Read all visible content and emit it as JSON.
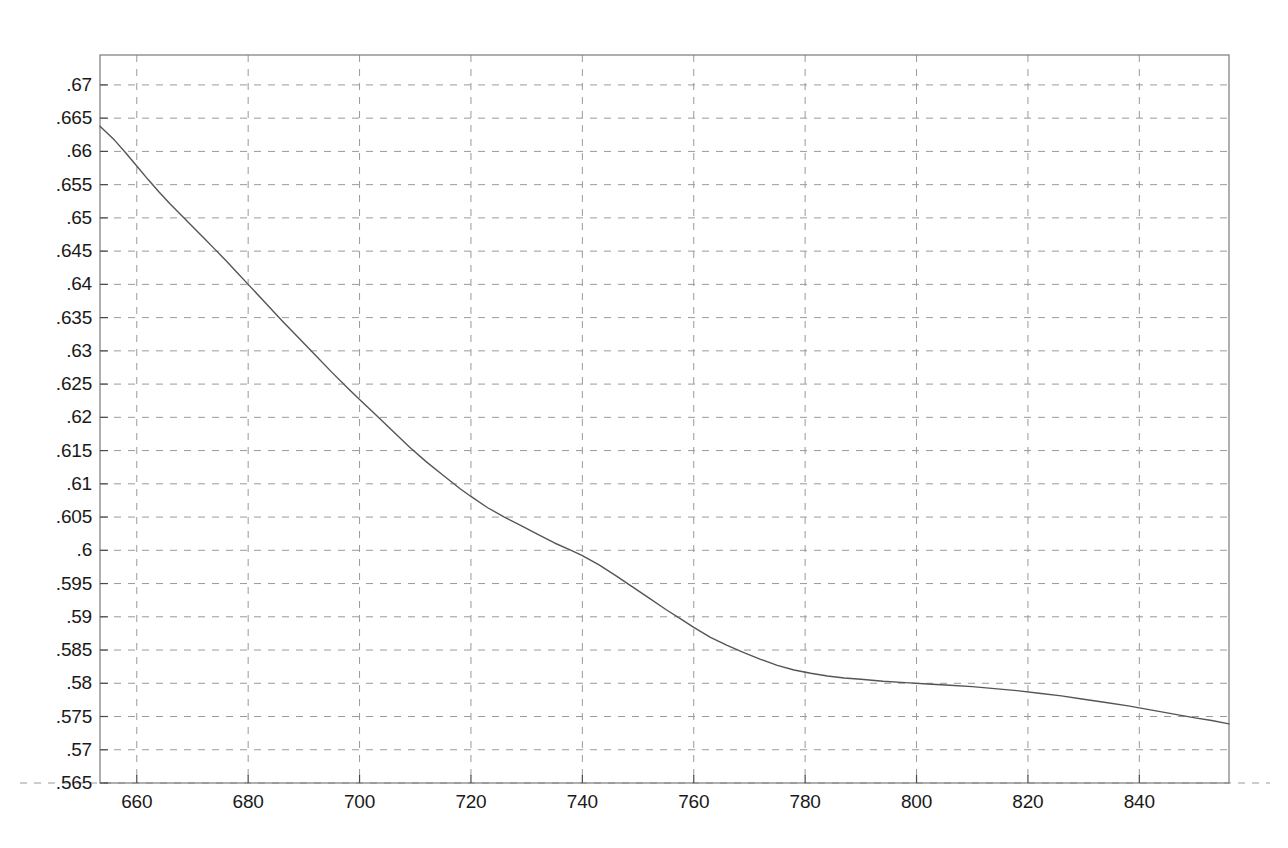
{
  "chart_data": {
    "type": "line",
    "title": "",
    "subtitle": "",
    "xlabel": "",
    "ylabel": "",
    "xlim": [
      653.4,
      856.1
    ],
    "ylim": [
      0.565,
      0.6745
    ],
    "grid": true,
    "grid_style": "dashed",
    "legend": null,
    "legend_position": "none",
    "xticks": [
      660,
      680,
      700,
      720,
      740,
      760,
      780,
      800,
      820,
      840
    ],
    "xtick_labels": [
      "660",
      "680",
      "700",
      "720",
      "740",
      "760",
      "780",
      "800",
      "820",
      "840"
    ],
    "yticks": [
      0.565,
      0.57,
      0.575,
      0.58,
      0.585,
      0.59,
      0.595,
      0.6,
      0.605,
      0.61,
      0.615,
      0.62,
      0.625,
      0.63,
      0.635,
      0.64,
      0.645,
      0.65,
      0.655,
      0.66,
      0.665,
      0.67
    ],
    "ytick_labels": [
      ".565",
      ".57",
      ".575",
      ".58",
      ".585",
      ".59",
      ".595",
      ".6",
      ".605",
      ".61",
      ".615",
      ".62",
      ".625",
      ".63",
      ".635",
      ".64",
      ".645",
      ".65",
      ".655",
      ".66",
      ".665",
      ".67"
    ],
    "series": [
      {
        "name": "curve",
        "color": "#555555",
        "line_width": 1.4,
        "x": [
          653.4,
          656,
          658,
          660,
          662,
          664,
          666,
          668,
          670,
          672,
          674,
          676,
          678,
          680,
          683,
          686,
          689,
          692,
          695,
          698,
          700,
          703,
          706,
          709,
          712,
          715,
          718,
          720,
          723,
          726,
          729,
          732,
          735,
          738,
          740,
          743,
          746,
          749,
          752,
          755,
          758,
          760,
          763,
          766,
          769,
          772,
          775,
          778,
          781,
          784,
          787,
          790,
          794,
          798,
          802,
          806,
          810,
          814,
          818,
          822,
          826,
          830,
          834,
          838,
          842,
          846,
          850,
          853,
          856.1
        ],
        "y": [
          0.6638,
          0.6617,
          0.6598,
          0.6578,
          0.6558,
          0.6539,
          0.6521,
          0.6504,
          0.6487,
          0.647,
          0.6453,
          0.6436,
          0.6418,
          0.64,
          0.6373,
          0.6346,
          0.632,
          0.6294,
          0.6268,
          0.6243,
          0.6227,
          0.6203,
          0.6179,
          0.6155,
          0.6133,
          0.6113,
          0.6093,
          0.6081,
          0.6064,
          0.605,
          0.6037,
          0.6024,
          0.6011,
          0.6,
          0.5992,
          0.5978,
          0.5962,
          0.5945,
          0.5928,
          0.5911,
          0.5895,
          0.5884,
          0.5869,
          0.5857,
          0.5846,
          0.5836,
          0.5827,
          0.582,
          0.5815,
          0.5811,
          0.5808,
          0.5806,
          0.5803,
          0.5801,
          0.5799,
          0.5797,
          0.5795,
          0.5792,
          0.5789,
          0.5785,
          0.5781,
          0.5776,
          0.5771,
          0.5766,
          0.576,
          0.5754,
          0.5748,
          0.5744,
          0.5739
        ]
      }
    ],
    "frame_color": "#7a7a7a",
    "grid_color": "#9a9a9a",
    "background": "#ffffff"
  }
}
